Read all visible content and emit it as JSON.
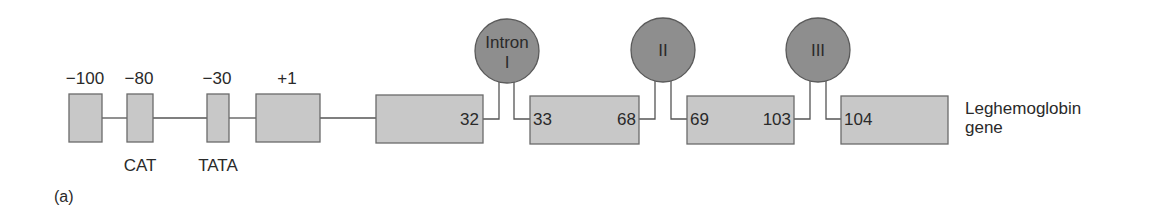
{
  "figure_label": "(a)",
  "gene_label_line1": "Leghemoglobin",
  "gene_label_line2": "gene",
  "colors": {
    "box_fill": "#c8c8c8",
    "box_stroke": "#6a6a6a",
    "circle_fill": "#8e8e8e",
    "circle_stroke": "#5a5a5a",
    "line": "#555555",
    "text": "#2a2a2a"
  },
  "promoter": {
    "positions": [
      "−100",
      "−80",
      "−30",
      "+1"
    ],
    "elements": [
      "CAT",
      "TATA"
    ]
  },
  "exons": [
    {
      "start": "",
      "end": "32"
    },
    {
      "start": "33",
      "end": "68"
    },
    {
      "start": "69",
      "end": "103"
    },
    {
      "start": "104",
      "end": ""
    }
  ],
  "introns": [
    {
      "line1": "Intron",
      "line2": "I"
    },
    {
      "line1": "II",
      "line2": ""
    },
    {
      "line1": "III",
      "line2": ""
    }
  ]
}
